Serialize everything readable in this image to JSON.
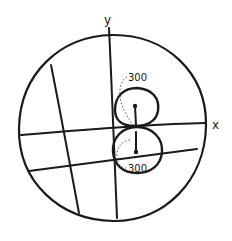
{
  "diagram": {
    "type": "hand-drawn circle with axes and two tangent circles",
    "labels": {
      "y_axis": "y",
      "x_axis": "x",
      "upper_angle": "300",
      "lower_angle": "300"
    },
    "colors": {
      "ink": "#1a1a1a",
      "background": "#ffffff"
    }
  }
}
